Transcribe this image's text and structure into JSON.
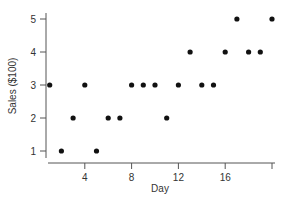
{
  "chart_data": {
    "type": "scatter",
    "title": "",
    "xlabel": "Day",
    "ylabel": "Sales ($100)",
    "x": [
      1,
      2,
      3,
      4,
      5,
      6,
      7,
      8,
      9,
      10,
      11,
      12,
      13,
      14,
      15,
      16,
      17,
      18,
      19,
      20
    ],
    "y": [
      3,
      1,
      2,
      3,
      1,
      2,
      2,
      3,
      3,
      3,
      2,
      3,
      4,
      3,
      3,
      4,
      5,
      4,
      4,
      5
    ],
    "xlim": [
      0,
      20
    ],
    "ylim": [
      0.8,
      5.2
    ],
    "xticks": [
      4,
      8,
      12,
      16,
      20
    ],
    "xtick_labels": [
      "4",
      "8",
      "12",
      "16",
      ""
    ],
    "yticks": [
      1,
      2,
      3,
      4,
      5
    ],
    "ytick_labels": [
      "1",
      "2",
      "3",
      "4",
      "5"
    ],
    "grid": false,
    "legend": null,
    "marker_color": "#111111",
    "axis_color": "#555555"
  }
}
